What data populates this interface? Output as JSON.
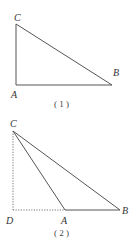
{
  "figures": [
    {
      "id": "fig1",
      "caption": "( 1 )",
      "points": {
        "C": {
          "label": "C",
          "x": 16,
          "y": 24
        },
        "A": {
          "label": "A",
          "x": 16,
          "y": 85
        },
        "B": {
          "label": "B",
          "x": 112,
          "y": 85
        }
      },
      "segments": [
        {
          "from": "C",
          "to": "A",
          "style": "solid"
        },
        {
          "from": "A",
          "to": "B",
          "style": "solid"
        },
        {
          "from": "C",
          "to": "B",
          "style": "solid"
        }
      ]
    },
    {
      "id": "fig2",
      "caption": "( 2 )",
      "points": {
        "C": {
          "label": "C",
          "x": 13,
          "y": 131
        },
        "D": {
          "label": "D",
          "x": 13,
          "y": 210
        },
        "A": {
          "label": "A",
          "x": 65,
          "y": 210
        },
        "B": {
          "label": "B",
          "x": 120,
          "y": 210
        }
      },
      "segments": [
        {
          "from": "C",
          "to": "D",
          "style": "dotted"
        },
        {
          "from": "D",
          "to": "A",
          "style": "dotted"
        },
        {
          "from": "A",
          "to": "B",
          "style": "solid"
        },
        {
          "from": "C",
          "to": "A",
          "style": "solid"
        },
        {
          "from": "C",
          "to": "B",
          "style": "solid"
        }
      ]
    }
  ]
}
